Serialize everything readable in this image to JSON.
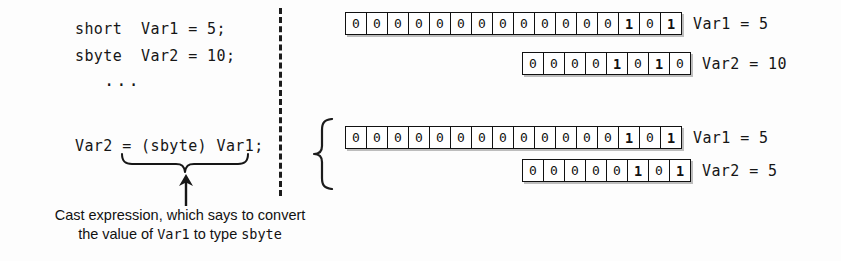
{
  "code": {
    "line1": "short  Var1 = 5;",
    "line2": "sbyte  Var2 = 10;",
    "ellipsis": "...",
    "line3": "Var2 = (sbyte) Var1;"
  },
  "caption": {
    "line1_part1": "Cast expression, which says to convert",
    "line2_part1": "the value of ",
    "line2_mono1": "Var1",
    "line2_part2": " to type ",
    "line2_mono2": "sbyte"
  },
  "icons": {
    "underbrace": "underbrace-icon",
    "arrow_up": "arrow-up-icon",
    "group_brace": "curly-brace-icon",
    "divider": "dashed-divider-icon"
  },
  "bit_rows": [
    {
      "name": "var1-before",
      "bits": [
        "0",
        "0",
        "0",
        "0",
        "0",
        "0",
        "0",
        "0",
        "0",
        "0",
        "0",
        "0",
        "0",
        "1",
        "0",
        "1"
      ],
      "label": "Var1 = 5",
      "width_bits": 16,
      "value": 5,
      "type": "short"
    },
    {
      "name": "var2-before",
      "bits": [
        "0",
        "0",
        "0",
        "0",
        "1",
        "0",
        "1",
        "0"
      ],
      "label": "Var2 = 10",
      "width_bits": 8,
      "value": 10,
      "type": "sbyte"
    },
    {
      "name": "var1-after",
      "bits": [
        "0",
        "0",
        "0",
        "0",
        "0",
        "0",
        "0",
        "0",
        "0",
        "0",
        "0",
        "0",
        "0",
        "1",
        "0",
        "1"
      ],
      "label": "Var1 = 5",
      "width_bits": 16,
      "value": 5,
      "type": "short"
    },
    {
      "name": "var2-after",
      "bits": [
        "0",
        "0",
        "0",
        "0",
        "0",
        "1",
        "0",
        "1"
      ],
      "label": "Var2 = 5",
      "width_bits": 8,
      "value": 5,
      "type": "sbyte"
    }
  ],
  "colors": {
    "background": "#fdfdfd",
    "ink": "#111111",
    "box_shadow": "#bdbdbd"
  }
}
